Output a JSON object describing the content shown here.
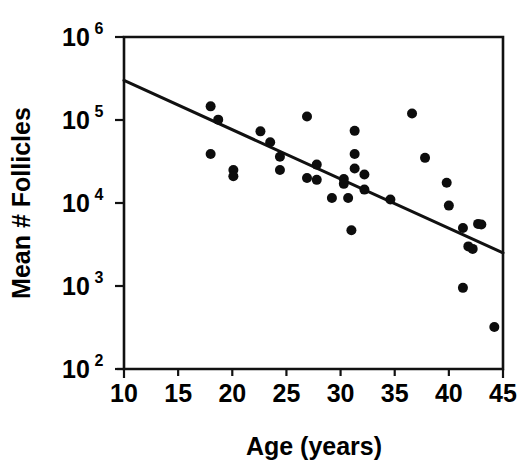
{
  "chart_data": {
    "type": "scatter",
    "title": "",
    "xlabel": "Age (years)",
    "ylabel": "Mean # Follicles",
    "xlim": [
      10,
      45
    ],
    "ylim": [
      100,
      1000000
    ],
    "yscale": "log",
    "xscale": "linear",
    "grid": false,
    "legend": null,
    "xticks": [
      10,
      15,
      20,
      25,
      30,
      35,
      40,
      45
    ],
    "xtick_labels": [
      "10",
      "15",
      "20",
      "25",
      "30",
      "35",
      "40",
      "45"
    ],
    "yticks": [
      100,
      1000,
      10000,
      100000,
      1000000
    ],
    "ytick_labels": [
      "10²",
      "10³",
      "10⁴",
      "10⁵",
      "10⁶"
    ],
    "ytick_mantissa": [
      "10",
      "10",
      "10",
      "10",
      "10"
    ],
    "ytick_exponent": [
      "2",
      "3",
      "4",
      "5",
      "6"
    ],
    "marker": "filled-circle",
    "marker_color": "#0d0d0d",
    "points": [
      {
        "x": 18.0,
        "y": 146000
      },
      {
        "x": 18.7,
        "y": 101000
      },
      {
        "x": 18.0,
        "y": 39000
      },
      {
        "x": 20.1,
        "y": 25000
      },
      {
        "x": 20.1,
        "y": 21000
      },
      {
        "x": 22.6,
        "y": 73000
      },
      {
        "x": 23.5,
        "y": 54000
      },
      {
        "x": 24.4,
        "y": 36000
      },
      {
        "x": 26.9,
        "y": 110000
      },
      {
        "x": 24.4,
        "y": 25000
      },
      {
        "x": 26.9,
        "y": 20000
      },
      {
        "x": 27.8,
        "y": 29000
      },
      {
        "x": 27.8,
        "y": 19000
      },
      {
        "x": 30.3,
        "y": 19500
      },
      {
        "x": 30.3,
        "y": 17000
      },
      {
        "x": 31.0,
        "y": 4700
      },
      {
        "x": 31.3,
        "y": 74000
      },
      {
        "x": 31.3,
        "y": 39000
      },
      {
        "x": 31.3,
        "y": 26000
      },
      {
        "x": 32.2,
        "y": 22000
      },
      {
        "x": 32.2,
        "y": 14500
      },
      {
        "x": 29.2,
        "y": 11500
      },
      {
        "x": 30.7,
        "y": 11500
      },
      {
        "x": 34.6,
        "y": 11000
      },
      {
        "x": 36.6,
        "y": 120000
      },
      {
        "x": 37.8,
        "y": 35000
      },
      {
        "x": 39.8,
        "y": 17500
      },
      {
        "x": 40.0,
        "y": 9300
      },
      {
        "x": 42.7,
        "y": 5600
      },
      {
        "x": 43.0,
        "y": 5500
      },
      {
        "x": 41.3,
        "y": 5000
      },
      {
        "x": 41.8,
        "y": 3000
      },
      {
        "x": 42.2,
        "y": 2800
      },
      {
        "x": 41.3,
        "y": 950
      },
      {
        "x": 44.2,
        "y": 320
      }
    ],
    "fit_line": {
      "type": "linear-regression-log",
      "x_start": 10,
      "y_start": 300000,
      "x_end": 45,
      "y_end": 2500
    }
  },
  "axes": {
    "x_title": "Age (years)",
    "y_title": "Mean # Follicles"
  }
}
